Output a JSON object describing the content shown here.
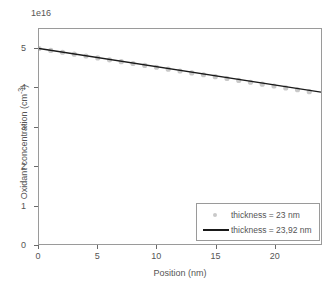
{
  "chart_data": {
    "type": "line",
    "title": "",
    "subtitle": "",
    "xlabel": "Position (nm)",
    "ylabel": "Oxidant concentration (cm",
    "ylabel_sup": "-3",
    "ylabel_suffix": ")",
    "offset_label": "1e16",
    "y_scale_factor": 1e+16,
    "xlim": [
      0,
      24
    ],
    "ylim": [
      0,
      5.5
    ],
    "xticks": [
      0,
      5,
      10,
      15,
      20
    ],
    "xtick_labels": [
      "0",
      "5",
      "10",
      "15",
      "20"
    ],
    "yticks": [
      0,
      1,
      2,
      3,
      4,
      5
    ],
    "ytick_labels": [
      "0",
      "1",
      "2",
      "3",
      "4",
      "5"
    ],
    "grid": false,
    "legend_position": "lower right",
    "series": [
      {
        "name": "thickness = 23 nm",
        "style": "scatter",
        "color": "#c9c9c9",
        "marker": "circle",
        "x": [
          0,
          1,
          2,
          3,
          4,
          5,
          6,
          7,
          8,
          9,
          10,
          11,
          12,
          13,
          14,
          15,
          16,
          17,
          18,
          19,
          20,
          21,
          22,
          23
        ],
        "values": [
          5.0,
          4.952,
          4.904,
          4.856,
          4.808,
          4.76,
          4.712,
          4.664,
          4.617,
          4.569,
          4.521,
          4.473,
          4.425,
          4.377,
          4.329,
          4.281,
          4.233,
          4.185,
          4.137,
          4.089,
          4.041,
          3.993,
          3.945,
          3.897
        ]
      },
      {
        "name": "thickness = 23,92 nm",
        "style": "line",
        "color": "#1a1a1a",
        "x": [
          0,
          24
        ],
        "values": [
          5.0,
          3.885
        ]
      }
    ],
    "legend_entries": [
      {
        "label": "thickness = 23 nm",
        "key": "marker",
        "color": "#c9c9c9"
      },
      {
        "label": "thickness = 23,92 nm",
        "key": "line",
        "color": "#1a1a1a"
      }
    ],
    "colors": {
      "background": "#ffffff",
      "axis": "#9a9a9a",
      "text": "#555555",
      "line": "#1a1a1a",
      "marker": "#c9c9c9"
    }
  }
}
